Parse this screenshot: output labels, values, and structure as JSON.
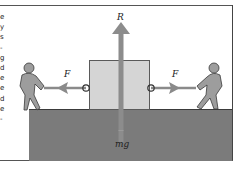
{
  "diagram": {
    "type": "free-body force diagram",
    "labels": {
      "reaction": "R",
      "weight": "mg",
      "force_left": "F",
      "force_right": "F"
    },
    "side_text_fragments": [
      "e",
      "y",
      "s",
      "-",
      "g",
      "d",
      "e",
      "e",
      "d",
      "e",
      "-"
    ],
    "colors": {
      "ground": "#7b7b7b",
      "block": "#d5d5d5",
      "arrow": "#8a8a8a",
      "figure": "#9a9a9a",
      "outline": "#3a3a3a"
    }
  }
}
